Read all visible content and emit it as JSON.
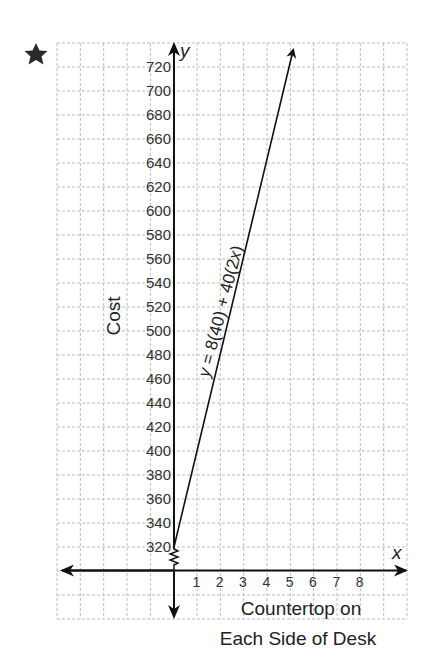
{
  "marker": {
    "icon": "star-icon"
  },
  "chart_data": {
    "type": "line",
    "title": "",
    "xlabel": "Countertop on Each Side of Desk",
    "xlabel_lines": [
      "Countertop on",
      "Each Side of Desk"
    ],
    "ylabel": "Cost",
    "x_axis_symbol": "x",
    "y_axis_symbol": "y",
    "x_ticks": [
      "1",
      "2",
      "3",
      "4",
      "5",
      "6",
      "7",
      "8"
    ],
    "y_ticks": [
      "320",
      "340",
      "360",
      "380",
      "400",
      "420",
      "440",
      "460",
      "480",
      "500",
      "520",
      "540",
      "560",
      "580",
      "600",
      "620",
      "640",
      "660",
      "680",
      "700",
      "720"
    ],
    "xlim": [
      0,
      8
    ],
    "ylim": [
      320,
      720
    ],
    "y_axis_break": true,
    "grid": true,
    "series": [
      {
        "name": "y = 8(40) + 40(2x)",
        "equation_parts": {
          "y": "y",
          "mid": " = 8(40) + 40(2",
          "x": "x",
          "end": ")"
        },
        "x": [
          0,
          1,
          2,
          3,
          4,
          5
        ],
        "y": [
          320,
          400,
          480,
          560,
          640,
          720
        ]
      }
    ]
  }
}
